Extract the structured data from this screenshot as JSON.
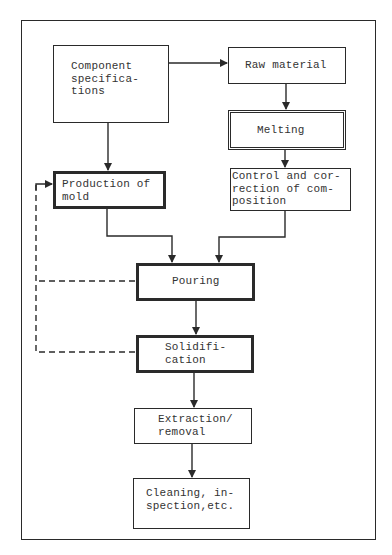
{
  "diagram": {
    "type": "flowchart",
    "nodes": [
      {
        "id": "component_specifications",
        "label": "Component\nspecifica-\ntions",
        "border": "single"
      },
      {
        "id": "raw_material",
        "label": "Raw material",
        "border": "single"
      },
      {
        "id": "melting",
        "label": "Melting",
        "border": "double"
      },
      {
        "id": "production_of_mold",
        "label": "Production of\nmold",
        "border": "thick"
      },
      {
        "id": "control_composition",
        "label": "Control and cor-\nrection of com-\nposition",
        "border": "single"
      },
      {
        "id": "pouring",
        "label": "Pouring",
        "border": "thick"
      },
      {
        "id": "solidification",
        "label": "Solidifi-\ncation",
        "border": "thick"
      },
      {
        "id": "extraction",
        "label": "Extraction/\nremoval",
        "border": "single"
      },
      {
        "id": "cleaning",
        "label": "Cleaning, in-\nspection,etc.",
        "border": "single"
      }
    ],
    "edges": [
      {
        "from": "component_specifications",
        "to": "raw_material",
        "style": "solid"
      },
      {
        "from": "component_specifications",
        "to": "production_of_mold",
        "style": "solid"
      },
      {
        "from": "raw_material",
        "to": "melting",
        "style": "solid"
      },
      {
        "from": "melting",
        "to": "control_composition",
        "style": "solid"
      },
      {
        "from": "production_of_mold",
        "to": "pouring",
        "style": "solid"
      },
      {
        "from": "control_composition",
        "to": "pouring",
        "style": "solid"
      },
      {
        "from": "pouring",
        "to": "solidification",
        "style": "solid"
      },
      {
        "from": "solidification",
        "to": "extraction",
        "style": "solid"
      },
      {
        "from": "extraction",
        "to": "cleaning",
        "style": "solid"
      },
      {
        "from": "pouring",
        "to": "production_of_mold",
        "style": "dashed"
      },
      {
        "from": "solidification",
        "to": "production_of_mold",
        "style": "dashed"
      }
    ],
    "colors": {
      "stroke": "#2a2a2a",
      "text": "#333333",
      "background": "#ffffff"
    }
  }
}
